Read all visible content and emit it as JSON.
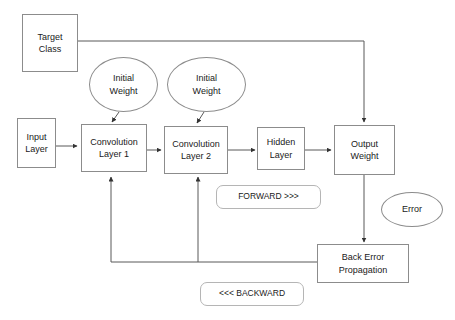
{
  "diagram": {
    "colors": {
      "stroke": "#8c8c8c",
      "pill_stroke": "#b5b5b5",
      "edge": "#595959",
      "text": "#1a1a1a",
      "background": "#ffffff"
    },
    "nodes": {
      "target_class": {
        "line1": "Target",
        "line2": "Class"
      },
      "input_layer": {
        "line1": "Input",
        "line2": "Layer"
      },
      "initial_weight_1": {
        "line1": "Initial",
        "line2": "Weight"
      },
      "initial_weight_2": {
        "line1": "Initial",
        "line2": "Weight"
      },
      "convolution_layer_1": {
        "line1": "Convolution",
        "line2": "Layer 1"
      },
      "convolution_layer_2": {
        "line1": "Convolution",
        "line2": "Layer 2"
      },
      "hidden_layer": {
        "line1": "Hidden",
        "line2": "Layer"
      },
      "output_weight": {
        "line1": "Output",
        "line2": "Weight"
      },
      "error": {
        "line1": "Error"
      },
      "back_error_propagation": {
        "line1": "Back Error",
        "line2": "Propagation"
      }
    },
    "labels": {
      "forward": "FORWARD >>>",
      "backward": "<<< BACKWARD"
    }
  }
}
